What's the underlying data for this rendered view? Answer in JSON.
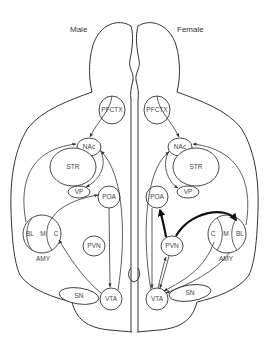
{
  "titles": {
    "left": "Male",
    "right": "Female"
  },
  "nodes": {
    "pfctx": "PFCTX",
    "nac": "NAc",
    "str": "STR",
    "vp": "VP",
    "poa": "POA",
    "bl": "BL",
    "m": "M",
    "c": "C",
    "amy": "AMY",
    "pvn": "PVN",
    "sn": "SN",
    "vta": "VTA"
  },
  "diagram": {
    "edges_male": [
      [
        "PFCTX",
        "NAc"
      ],
      [
        "NAc",
        "VP"
      ],
      [
        "BL",
        "NAc"
      ],
      [
        "C",
        "POA"
      ],
      [
        "POA",
        "VTA"
      ],
      [
        "VTA",
        "NAc"
      ],
      [
        "VTA",
        "C"
      ]
    ],
    "edges_female": [
      [
        "PFCTX",
        "NAc"
      ],
      [
        "NAc",
        "VP"
      ],
      [
        "BL",
        "NAc"
      ],
      [
        "VTA",
        "NAc"
      ],
      [
        "PVN",
        "POA",
        "bold"
      ],
      [
        "PVN",
        "BL",
        "bold"
      ],
      [
        "POA",
        "VTA"
      ],
      [
        "PVN",
        "VTA"
      ],
      [
        "VTA",
        "PVN"
      ],
      [
        "C",
        "VTA"
      ],
      [
        "BL",
        "VTA"
      ]
    ]
  }
}
